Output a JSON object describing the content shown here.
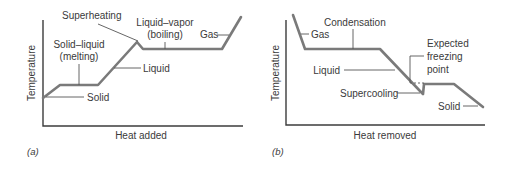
{
  "panels": [
    {
      "tag": "(a)",
      "x_axis_label": "Heat added",
      "y_axis_label": "Temperature",
      "labels": {
        "superheating": "Superheating",
        "liquid_vapor_line1": "Liquid–vapor",
        "liquid_vapor_line2": "(boiling)",
        "gas": "Gas",
        "solid_liquid_line1": "Solid–liquid",
        "solid_liquid_line2": "(melting)",
        "liquid": "Liquid",
        "solid": "Solid"
      }
    },
    {
      "tag": "(b)",
      "x_axis_label": "Heat removed",
      "y_axis_label": "Temperature",
      "labels": {
        "condensation": "Condensation",
        "gas": "Gas",
        "expected_line1": "Expected",
        "expected_line2": "freezing",
        "expected_line3": "point",
        "liquid": "Liquid",
        "supercooling": "Supercooling",
        "solid": "Solid"
      }
    }
  ],
  "colors": {
    "curve": "#7a7a7a",
    "axis": "#3c3c3c",
    "text": "#3a3a3a",
    "background": "#ffffff"
  }
}
